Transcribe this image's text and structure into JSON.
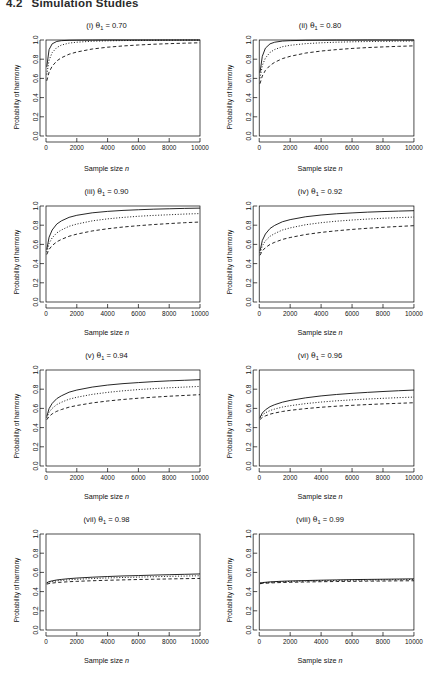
{
  "header": {
    "section_number": "4.2",
    "title": "Simulation Studies"
  },
  "axes": {
    "xlabel_prefix": "Sample size",
    "xlabel_var": "n",
    "ylabel": "Probability of harmony",
    "xticks": [
      "0",
      "2000",
      "4000",
      "6000",
      "8000",
      "10000"
    ],
    "yticks": [
      "0.0",
      "0.2",
      "0.4",
      "0.6",
      "0.8",
      "1.0"
    ],
    "xlim": [
      0,
      10000
    ],
    "ylim": [
      0.0,
      1.0
    ]
  },
  "style": {
    "line_color": "#000000",
    "background": "#ffffff",
    "axis_color": "#000000"
  },
  "panels": [
    {
      "roman": "(i)",
      "param": "θ",
      "sub": "1",
      "eq": "=",
      "value": "0.70",
      "title_text": "(i) θ1 = 0.70"
    },
    {
      "roman": "(ii)",
      "param": "θ",
      "sub": "1",
      "eq": "=",
      "value": "0.80",
      "title_text": "(ii) θ1 = 0.80"
    },
    {
      "roman": "(iii)",
      "param": "θ",
      "sub": "1",
      "eq": "=",
      "value": "0.90",
      "title_text": "(iii) θ1 = 0.90"
    },
    {
      "roman": "(iv)",
      "param": "θ",
      "sub": "1",
      "eq": "=",
      "value": "0.92",
      "title_text": "(iv) θ1 = 0.92"
    },
    {
      "roman": "(v)",
      "param": "θ",
      "sub": "1",
      "eq": "=",
      "value": "0.94",
      "title_text": "(v) θ1 = 0.94"
    },
    {
      "roman": "(vi)",
      "param": "θ",
      "sub": "1",
      "eq": "=",
      "value": "0.96",
      "title_text": "(vi) θ1 = 0.96"
    },
    {
      "roman": "(vii)",
      "param": "θ",
      "sub": "1",
      "eq": "=",
      "value": "0.98",
      "title_text": "(vii) θ1 = 0.98"
    },
    {
      "roman": "(viii)",
      "param": "θ",
      "sub": "1",
      "eq": "=",
      "value": "0.99",
      "title_text": "(viii) θ1 = 0.99"
    }
  ],
  "chart_data": {
    "type": "line",
    "title": "Simulation Studies",
    "xlabel": "Sample size n",
    "ylabel": "Probability of harmony",
    "xlim": [
      0,
      10000
    ],
    "ylim": [
      0.0,
      1.0
    ],
    "xticks": [
      0,
      2000,
      4000,
      6000,
      8000,
      10000
    ],
    "yticks": [
      0.0,
      0.2,
      0.4,
      0.6,
      0.8,
      1.0
    ],
    "grid": false,
    "legend": "none",
    "x": [
      50,
      200,
      400,
      700,
      1000,
      1500,
      2000,
      3000,
      4000,
      5000,
      6000,
      7000,
      8000,
      9000,
      10000
    ],
    "panels": [
      {
        "label": "(i) θ1 = 0.70",
        "theta1": 0.7,
        "series": [
          {
            "name": "solid",
            "style": "solid",
            "values": [
              0.72,
              0.9,
              0.96,
              0.985,
              0.993,
              0.997,
              0.998,
              0.999,
              1.0,
              1.0,
              1.0,
              1.0,
              1.0,
              1.0,
              1.0
            ]
          },
          {
            "name": "dotted",
            "style": "dotted",
            "values": [
              0.64,
              0.79,
              0.868,
              0.921,
              0.947,
              0.968,
              0.977,
              0.987,
              0.991,
              0.994,
              0.996,
              0.997,
              0.998,
              0.999,
              0.999
            ]
          },
          {
            "name": "dashed",
            "style": "dashed",
            "values": [
              0.575,
              0.665,
              0.727,
              0.782,
              0.815,
              0.852,
              0.875,
              0.906,
              0.925,
              0.938,
              0.948,
              0.956,
              0.962,
              0.967,
              0.971
            ]
          }
        ]
      },
      {
        "label": "(ii) θ1 = 0.80",
        "theta1": 0.8,
        "series": [
          {
            "name": "solid",
            "style": "solid",
            "values": [
              0.66,
              0.83,
              0.915,
              0.96,
              0.977,
              0.989,
              0.993,
              0.997,
              0.998,
              0.999,
              0.999,
              1.0,
              1.0,
              1.0,
              1.0
            ]
          },
          {
            "name": "dotted",
            "style": "dotted",
            "values": [
              0.6,
              0.735,
              0.812,
              0.871,
              0.901,
              0.93,
              0.945,
              0.962,
              0.971,
              0.977,
              0.981,
              0.984,
              0.986,
              0.988,
              0.989
            ]
          },
          {
            "name": "dashed",
            "style": "dashed",
            "values": [
              0.545,
              0.625,
              0.683,
              0.735,
              0.768,
              0.806,
              0.83,
              0.864,
              0.885,
              0.9,
              0.912,
              0.921,
              0.928,
              0.934,
              0.939
            ]
          }
        ]
      },
      {
        "label": "(iii) θ1 = 0.90",
        "theta1": 0.9,
        "series": [
          {
            "name": "solid",
            "style": "solid",
            "values": [
              0.545,
              0.675,
              0.75,
              0.812,
              0.845,
              0.882,
              0.903,
              0.929,
              0.944,
              0.954,
              0.961,
              0.967,
              0.971,
              0.975,
              0.978
            ]
          },
          {
            "name": "dotted",
            "style": "dotted",
            "values": [
              0.52,
              0.61,
              0.668,
              0.72,
              0.75,
              0.789,
              0.812,
              0.845,
              0.866,
              0.881,
              0.893,
              0.902,
              0.909,
              0.916,
              0.921
            ]
          },
          {
            "name": "dashed",
            "style": "dashed",
            "values": [
              0.495,
              0.548,
              0.588,
              0.627,
              0.652,
              0.685,
              0.707,
              0.74,
              0.763,
              0.781,
              0.795,
              0.807,
              0.817,
              0.826,
              0.833
            ]
          }
        ]
      },
      {
        "label": "(iv) θ1 = 0.92",
        "theta1": 0.92,
        "series": [
          {
            "name": "solid",
            "style": "solid",
            "values": [
              0.53,
              0.64,
              0.708,
              0.766,
              0.798,
              0.836,
              0.858,
              0.888,
              0.906,
              0.919,
              0.928,
              0.936,
              0.942,
              0.947,
              0.951
            ]
          },
          {
            "name": "dotted",
            "style": "dotted",
            "values": [
              0.51,
              0.585,
              0.637,
              0.685,
              0.713,
              0.75,
              0.772,
              0.805,
              0.826,
              0.842,
              0.854,
              0.864,
              0.872,
              0.879,
              0.885
            ]
          },
          {
            "name": "dashed",
            "style": "dashed",
            "values": [
              0.487,
              0.532,
              0.566,
              0.6,
              0.622,
              0.652,
              0.672,
              0.703,
              0.725,
              0.742,
              0.756,
              0.768,
              0.778,
              0.787,
              0.795
            ]
          }
        ]
      },
      {
        "label": "(v) θ1 = 0.94",
        "theta1": 0.94,
        "series": [
          {
            "name": "solid",
            "style": "solid",
            "values": [
              0.515,
              0.598,
              0.652,
              0.702,
              0.731,
              0.769,
              0.791,
              0.822,
              0.843,
              0.858,
              0.869,
              0.879,
              0.887,
              0.893,
              0.899
            ]
          },
          {
            "name": "dotted",
            "style": "dotted",
            "values": [
              0.502,
              0.56,
              0.6,
              0.64,
              0.664,
              0.696,
              0.716,
              0.746,
              0.767,
              0.783,
              0.796,
              0.806,
              0.815,
              0.822,
              0.829
            ]
          },
          {
            "name": "dashed",
            "style": "dashed",
            "values": [
              0.482,
              0.516,
              0.543,
              0.57,
              0.588,
              0.613,
              0.63,
              0.657,
              0.677,
              0.693,
              0.706,
              0.717,
              0.727,
              0.735,
              0.743
            ]
          }
        ]
      },
      {
        "label": "(vi) θ1 = 0.96",
        "theta1": 0.96,
        "series": [
          {
            "name": "solid",
            "style": "solid",
            "values": [
              0.505,
              0.552,
              0.585,
              0.618,
              0.639,
              0.665,
              0.683,
              0.71,
              0.73,
              0.745,
              0.757,
              0.767,
              0.776,
              0.784,
              0.791
            ]
          },
          {
            "name": "dotted",
            "style": "dotted",
            "values": [
              0.498,
              0.531,
              0.554,
              0.578,
              0.593,
              0.614,
              0.628,
              0.65,
              0.666,
              0.679,
              0.689,
              0.698,
              0.705,
              0.712,
              0.718
            ]
          },
          {
            "name": "dashed",
            "style": "dashed",
            "values": [
              0.484,
              0.506,
              0.522,
              0.54,
              0.552,
              0.568,
              0.58,
              0.598,
              0.612,
              0.623,
              0.632,
              0.64,
              0.647,
              0.653,
              0.659
            ]
          }
        ]
      },
      {
        "label": "(vii) θ1 = 0.98",
        "theta1": 0.98,
        "series": [
          {
            "name": "solid",
            "style": "solid",
            "values": [
              0.492,
              0.504,
              0.512,
              0.521,
              0.527,
              0.535,
              0.541,
              0.55,
              0.557,
              0.563,
              0.567,
              0.572,
              0.576,
              0.58,
              0.584
            ]
          },
          {
            "name": "dotted",
            "style": "dotted",
            "values": [
              0.489,
              0.498,
              0.504,
              0.511,
              0.516,
              0.523,
              0.528,
              0.536,
              0.542,
              0.547,
              0.551,
              0.555,
              0.559,
              0.562,
              0.565
            ]
          },
          {
            "name": "dashed",
            "style": "dashed",
            "values": [
              0.478,
              0.484,
              0.489,
              0.494,
              0.498,
              0.503,
              0.507,
              0.513,
              0.518,
              0.522,
              0.526,
              0.529,
              0.532,
              0.535,
              0.537
            ]
          }
        ]
      },
      {
        "label": "(viii) θ1 = 0.99",
        "theta1": 0.99,
        "series": [
          {
            "name": "solid",
            "style": "solid",
            "values": [
              0.489,
              0.494,
              0.497,
              0.501,
              0.504,
              0.508,
              0.511,
              0.515,
              0.519,
              0.522,
              0.525,
              0.527,
              0.529,
              0.531,
              0.533
            ]
          },
          {
            "name": "dotted",
            "style": "dotted",
            "values": [
              0.487,
              0.491,
              0.494,
              0.497,
              0.5,
              0.503,
              0.506,
              0.51,
              0.513,
              0.516,
              0.518,
              0.52,
              0.522,
              0.524,
              0.526
            ]
          },
          {
            "name": "dashed",
            "style": "dashed",
            "values": [
              0.482,
              0.485,
              0.487,
              0.49,
              0.492,
              0.495,
              0.497,
              0.5,
              0.503,
              0.505,
              0.507,
              0.509,
              0.51,
              0.512,
              0.513
            ]
          }
        ]
      }
    ]
  }
}
